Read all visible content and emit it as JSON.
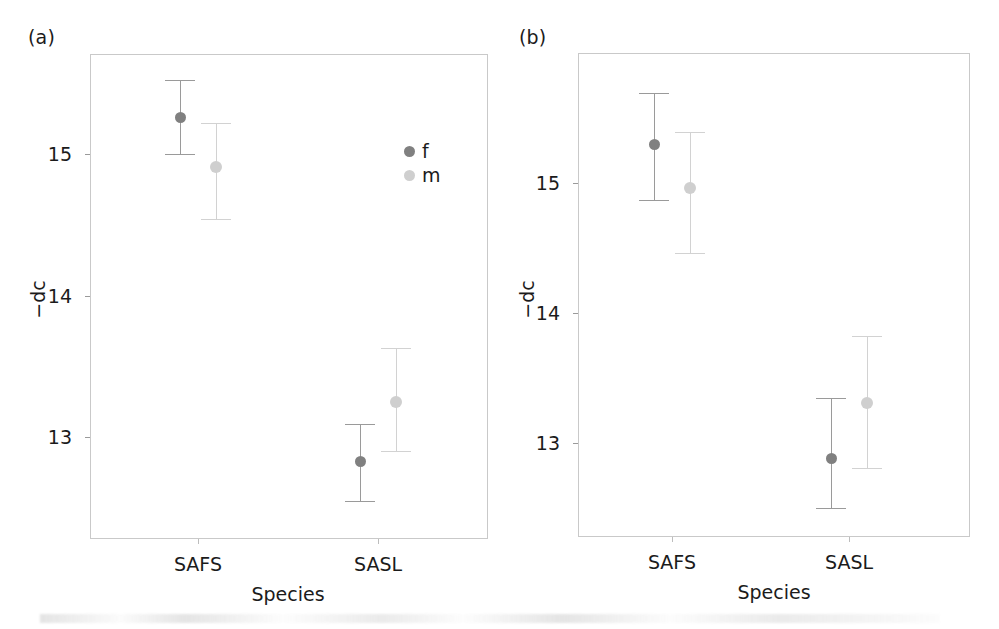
{
  "figure": {
    "panels": [
      {
        "tag": "(a)",
        "ylabel": "−dc",
        "xlabel": "Species",
        "has_legend": true
      },
      {
        "tag": "(b)",
        "ylabel": "−dc",
        "xlabel": "Species",
        "has_legend": false
      }
    ],
    "legend": {
      "title": "",
      "entries": [
        {
          "label": "f",
          "color": "#808080"
        },
        {
          "label": "m",
          "color": "#cfcfcf"
        }
      ]
    },
    "colors": {
      "female_marker": "#808080",
      "male_marker": "#cfcfcf",
      "female_errorbar": "#9a9a9a",
      "male_errorbar": "#d2d2d2",
      "frame": "#c9c9c9",
      "text": "#1b1b1b",
      "background": "#ffffff"
    }
  },
  "chart_data": [
    {
      "type": "scatter",
      "panel": "(a)",
      "title": "",
      "xlabel": "Species",
      "ylabel": "−dc",
      "categories": [
        "SAFS",
        "SASL"
      ],
      "ytick_labels": [
        "15",
        "14",
        "13"
      ],
      "ytick_values": [
        15,
        14,
        13
      ],
      "ylim": [
        12.45,
        15.77
      ],
      "grid": false,
      "legend_position": "inside-right",
      "series": [
        {
          "name": "f",
          "color": "#808080",
          "values": [
            15.26,
            12.83
          ],
          "ci_low": [
            15.0,
            12.55
          ],
          "ci_high": [
            15.52,
            13.09
          ]
        },
        {
          "name": "m",
          "color": "#cfcfcf",
          "values": [
            14.91,
            13.25
          ],
          "ci_low": [
            14.54,
            12.9
          ],
          "ci_high": [
            15.22,
            13.63
          ]
        }
      ]
    },
    {
      "type": "scatter",
      "panel": "(b)",
      "title": "",
      "xlabel": "Species",
      "ylabel": "−dc",
      "categories": [
        "SAFS",
        "SASL"
      ],
      "ytick_labels": [
        "15",
        "14",
        "13"
      ],
      "ytick_values": [
        15,
        14,
        13
      ],
      "ylim": [
        12.32,
        15.82
      ],
      "grid": false,
      "legend_position": "none",
      "series": [
        {
          "name": "f",
          "color": "#808080",
          "values": [
            15.3,
            12.88
          ],
          "ci_low": [
            14.87,
            12.5
          ],
          "ci_high": [
            15.69,
            13.35
          ]
        },
        {
          "name": "m",
          "color": "#cfcfcf",
          "values": [
            14.96,
            13.31
          ],
          "ci_low": [
            14.46,
            12.81
          ],
          "ci_high": [
            15.39,
            13.82
          ]
        }
      ]
    }
  ]
}
